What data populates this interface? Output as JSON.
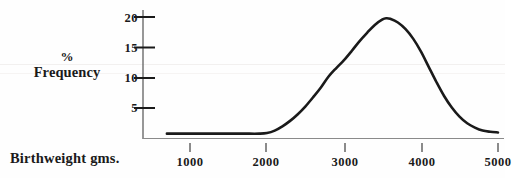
{
  "figure": {
    "background_color": "#fefefe",
    "ink_color": "#1a1a1a",
    "axis_color": "#6b6b6b"
  },
  "labels": {
    "y_title_line1": "%",
    "y_title_line2": "Frequency",
    "x_title": "Birthweight gms."
  },
  "chart_data": {
    "type": "line",
    "title": "",
    "xlabel": "Birthweight gms.",
    "ylabel": "% Frequency",
    "xlim": [
      500,
      5000
    ],
    "ylim": [
      0,
      21.5
    ],
    "xticks": [
      1000,
      2000,
      3000,
      4000,
      5000
    ],
    "xtick_labels": [
      "1000",
      "2000",
      "3000",
      "4000",
      "5000"
    ],
    "yticks": [
      5,
      10,
      15,
      20
    ],
    "ytick_labels": [
      "5",
      "10",
      "15",
      "20"
    ],
    "grid": false,
    "legend": null,
    "x": [
      700,
      900,
      1100,
      1300,
      1500,
      1700,
      1900,
      2000,
      2100,
      2200,
      2300,
      2400,
      2500,
      2600,
      2700,
      2800,
      2900,
      3000,
      3100,
      3200,
      3300,
      3400,
      3500,
      3550,
      3600,
      3700,
      3800,
      3900,
      4000,
      4100,
      4200,
      4300,
      4400,
      4500,
      4600,
      4700,
      4800,
      4900,
      5000
    ],
    "values": [
      0.8,
      0.8,
      0.8,
      0.8,
      0.8,
      0.8,
      0.8,
      0.9,
      1.3,
      2.0,
      2.9,
      4.0,
      5.3,
      6.8,
      8.4,
      10.2,
      11.6,
      12.9,
      14.4,
      16.0,
      17.4,
      18.7,
      19.6,
      19.8,
      19.7,
      19.1,
      18.0,
      16.4,
      14.3,
      11.8,
      9.3,
      7.0,
      5.1,
      3.6,
      2.5,
      1.8,
      1.3,
      1.1,
      1.0
    ],
    "series_name": "Birthweight distribution",
    "peak": {
      "x": 3550,
      "y": 19.8
    },
    "baseline_start_x": 700
  }
}
